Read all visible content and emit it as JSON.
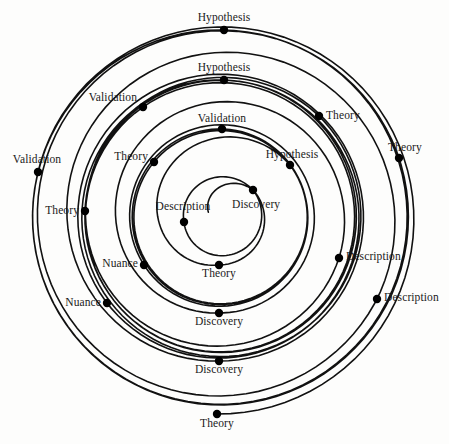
{
  "figure": {
    "type": "spiral-diagram",
    "title": "",
    "background_color": "#fdfdfc",
    "line_color": "#111111",
    "dot_color": "#000000",
    "text_color": "#1a1a1a",
    "center": {
      "x": 220,
      "y": 217
    },
    "dot_radius": 4.2,
    "stroke_width": 1.6
  },
  "chart_data": {
    "type": "scatter",
    "title": "",
    "xlabel": "",
    "ylabel": "",
    "sequence": [
      "Discovery",
      "Description",
      "Theory",
      "Hypothesis",
      "Validation",
      "Theory",
      "Nuance",
      "Discovery",
      "Description",
      "Theory",
      "Hypothesis",
      "Validation",
      "Theory",
      "Nuance",
      "Discovery",
      "Description",
      "Theory"
    ],
    "nodes": [
      {
        "label": "Discovery",
        "x": 253,
        "y": 190,
        "angle_deg": 0,
        "turn": 0,
        "anchor": "belowright",
        "lx": 232,
        "ly": 199
      },
      {
        "label": "Description",
        "x": 184,
        "y": 222,
        "angle_deg": 180,
        "turn": 0,
        "anchor": "center",
        "lx": 183,
        "ly": 212
      },
      {
        "label": "Theory",
        "x": 219,
        "y": 265,
        "angle_deg": 270,
        "turn": 0,
        "anchor": "below",
        "lx": 219,
        "ly": 268
      },
      {
        "label": "Hypothesis",
        "x": 290,
        "y": 165,
        "angle_deg": 45,
        "turn": 1,
        "anchor": "center",
        "lx": 292,
        "ly": 160
      },
      {
        "label": "Validation",
        "x": 222,
        "y": 129,
        "angle_deg": 90,
        "turn": 1,
        "anchor": "center",
        "lx": 222,
        "ly": 124
      },
      {
        "label": "Theory",
        "x": 154,
        "y": 162,
        "angle_deg": 135,
        "turn": 1,
        "anchor": "left",
        "lx": 148,
        "ly": 157
      },
      {
        "label": "Nuance",
        "x": 144,
        "y": 265,
        "angle_deg": 225,
        "turn": 1,
        "anchor": "left",
        "lx": 138,
        "ly": 264
      },
      {
        "label": "Discovery",
        "x": 219,
        "y": 313,
        "angle_deg": 270,
        "turn": 1,
        "anchor": "below",
        "lx": 219,
        "ly": 316
      },
      {
        "label": "Description",
        "x": 339,
        "y": 258,
        "angle_deg": 335,
        "turn": 1,
        "anchor": "right",
        "lx": 346,
        "ly": 257
      },
      {
        "label": "Theory",
        "x": 319,
        "y": 116,
        "angle_deg": 45,
        "turn": 2,
        "anchor": "right",
        "lx": 326,
        "ly": 116
      },
      {
        "label": "Hypothesis",
        "x": 224,
        "y": 80,
        "angle_deg": 90,
        "turn": 2,
        "anchor": "center",
        "lx": 224,
        "ly": 73
      },
      {
        "label": "Validation",
        "x": 143,
        "y": 107,
        "angle_deg": 125,
        "turn": 2,
        "anchor": "left",
        "lx": 137,
        "ly": 98
      },
      {
        "label": "Theory",
        "x": 85,
        "y": 211,
        "angle_deg": 180,
        "turn": 2,
        "anchor": "left",
        "lx": 79,
        "ly": 211
      },
      {
        "label": "Nuance",
        "x": 107,
        "y": 303,
        "angle_deg": 225,
        "turn": 2,
        "anchor": "left",
        "lx": 101,
        "ly": 303
      },
      {
        "label": "Discovery",
        "x": 219,
        "y": 361,
        "angle_deg": 270,
        "turn": 2,
        "anchor": "below",
        "lx": 219,
        "ly": 364
      },
      {
        "label": "Description",
        "x": 377,
        "y": 299,
        "angle_deg": 330,
        "turn": 2,
        "anchor": "right",
        "lx": 384,
        "ly": 298
      },
      {
        "label": "Theory",
        "x": 399,
        "y": 158,
        "angle_deg": 30,
        "turn": 3,
        "anchor": "right",
        "lx": 388,
        "ly": 148
      },
      {
        "label": "Hypothesis",
        "x": 224,
        "y": 30,
        "angle_deg": 90,
        "turn": 3,
        "anchor": "center",
        "lx": 224,
        "ly": 23
      },
      {
        "label": "Validation",
        "x": 38,
        "y": 172,
        "angle_deg": 180,
        "turn": 3,
        "anchor": "center",
        "lx": 37,
        "ly": 165
      },
      {
        "label": "Theory",
        "x": 217,
        "y": 414,
        "angle_deg": 270,
        "turn": 3,
        "anchor": "below",
        "lx": 217,
        "ly": 418
      }
    ]
  }
}
